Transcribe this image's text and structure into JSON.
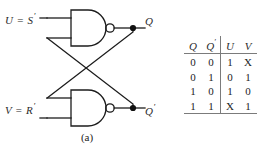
{
  "figure": {
    "captions": {
      "a": "(a)",
      "b": "(b)"
    }
  },
  "circuit": {
    "name": "cross-coupled-nand-latch",
    "gates": [
      {
        "id": "top-nand",
        "type": "NAND",
        "label": ""
      },
      {
        "id": "bottom-nand",
        "type": "NAND",
        "label": ""
      }
    ],
    "inputs": [
      {
        "id": "u-input",
        "text": "U = S",
        "prime": "′"
      },
      {
        "id": "v-input",
        "text": "V = R",
        "prime": "′"
      }
    ],
    "outputs": [
      {
        "id": "q-output",
        "text": "Q",
        "prime": ""
      },
      {
        "id": "q-prime-output",
        "text": "Q",
        "prime": "′"
      }
    ],
    "stroke_color": "#1c1c1c",
    "junction_color": "#111111"
  },
  "table": {
    "name": "excitation-table",
    "headers": [
      "Q",
      "Q′",
      "U",
      "V"
    ],
    "header_primes": [
      "",
      "′",
      "",
      ""
    ],
    "header_base": [
      "Q",
      "Q",
      "U",
      "V"
    ],
    "rows": [
      [
        "0",
        "0",
        "1",
        "X"
      ],
      [
        "0",
        "1",
        "0",
        "1"
      ],
      [
        "1",
        "0",
        "1",
        "0"
      ],
      [
        "1",
        "1",
        "X",
        "1"
      ]
    ],
    "rule_color": "#7b7b7b"
  }
}
